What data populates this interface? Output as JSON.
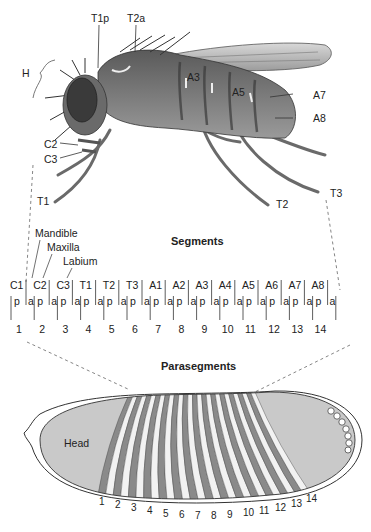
{
  "fly": {
    "labels": {
      "H": "H",
      "T1p": "T1p",
      "T2a": "T2a",
      "A3": "A3",
      "A5": "A5",
      "A7": "A7",
      "A8": "A8",
      "C2": "C2",
      "C3": "C3",
      "T1": "T1",
      "T2": "T2",
      "T3": "T3"
    }
  },
  "mouthparts": {
    "mandible": "Mandible",
    "maxilla": "Maxilla",
    "labium": "Labium"
  },
  "segments": {
    "title": "Segments",
    "names": [
      "C1",
      "C2",
      "C3",
      "T1",
      "T2",
      "T3",
      "A1",
      "A2",
      "A3",
      "A4",
      "A5",
      "A6",
      "A7",
      "A8"
    ],
    "compartments": [
      "p",
      "a"
    ],
    "parasegment_numbers": [
      "1",
      "2",
      "3",
      "4",
      "5",
      "6",
      "7",
      "8",
      "9",
      "10",
      "11",
      "12",
      "13",
      "14"
    ]
  },
  "parasegments": {
    "title": "Parasegments",
    "head_label": "Head",
    "stripe_numbers": [
      "1",
      "2",
      "3",
      "4",
      "5",
      "6",
      "7",
      "8",
      "9",
      "10",
      "11",
      "12",
      "13",
      "14"
    ]
  },
  "colors": {
    "fill_gray": "#c9c9c9",
    "stripe_dark": "#8a8a8a",
    "stripe_light": "#f2f2f2",
    "outline": "#333333"
  }
}
